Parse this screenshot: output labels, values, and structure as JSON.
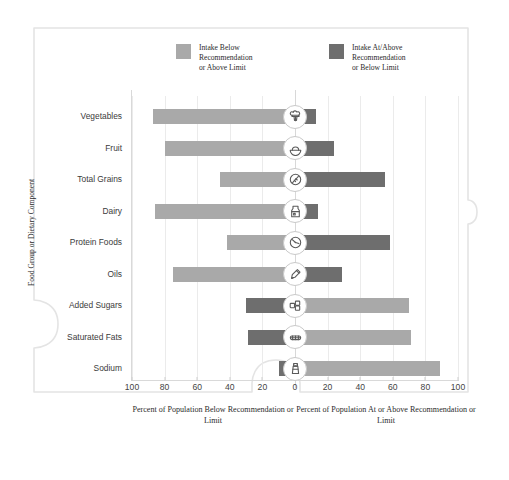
{
  "chart_data": {
    "type": "bar",
    "orientation": "horizontal-diverging",
    "title": "",
    "subtitle": "",
    "xlabel_left": "Percent of Population Below Recommendation or Limit",
    "xlabel_right": "Percent of Population At or Above Recommendation or Limit",
    "ylabel": "Food Group or Dietary Component",
    "grid": true,
    "legend_position": "top",
    "xlim": [
      -100,
      100
    ],
    "xticks": [
      {
        "label": "100",
        "value": -100
      },
      {
        "label": "80",
        "value": -80
      },
      {
        "label": "60",
        "value": -60
      },
      {
        "label": "40",
        "value": -40
      },
      {
        "label": "20",
        "value": -20
      },
      {
        "label": "0",
        "value": 0
      },
      {
        "label": "20",
        "value": 20
      },
      {
        "label": "40",
        "value": 40
      },
      {
        "label": "60",
        "value": 60
      },
      {
        "label": "80",
        "value": 80
      },
      {
        "label": "100",
        "value": 100
      }
    ],
    "categories": [
      "Vegetables",
      "Fruit",
      "Total Grains",
      "Dairy",
      "Protein Foods",
      "Oils",
      "Added Sugars",
      "Saturated Fats",
      "Sodium"
    ],
    "series": [
      {
        "name": "Intake Below Recommendation or Above Limit",
        "color": "#a9a9a9",
        "values": [
          87,
          80,
          46,
          86,
          42,
          75,
          70,
          71,
          89
        ]
      },
      {
        "name": "Intake At/Above Recommendation or Below Limit",
        "color": "#6e6e6e",
        "values": [
          13,
          20,
          54,
          14,
          58,
          25,
          30,
          29,
          11
        ]
      }
    ],
    "rows": [
      {
        "category": "Vegetables",
        "left_value": 87,
        "right_value": 13,
        "left_color": "#a9a9a9",
        "right_color": "#6e6e6e",
        "icon": "broccoli-icon"
      },
      {
        "category": "Fruit",
        "left_value": 80,
        "right_value": 24,
        "left_color": "#a9a9a9",
        "right_color": "#6e6e6e",
        "icon": "fruit-icon"
      },
      {
        "category": "Total Grains",
        "left_value": 46,
        "right_value": 55,
        "left_color": "#a9a9a9",
        "right_color": "#6e6e6e",
        "icon": "grains-icon"
      },
      {
        "category": "Dairy",
        "left_value": 86,
        "right_value": 14,
        "left_color": "#a9a9a9",
        "right_color": "#6e6e6e",
        "icon": "dairy-icon"
      },
      {
        "category": "Protein Foods",
        "left_value": 42,
        "right_value": 58,
        "left_color": "#a9a9a9",
        "right_color": "#6e6e6e",
        "icon": "protein-icon"
      },
      {
        "category": "Oils",
        "left_value": 75,
        "right_value": 29,
        "left_color": "#a9a9a9",
        "right_color": "#6e6e6e",
        "icon": "oils-icon"
      },
      {
        "category": "Added Sugars",
        "left_value": 30,
        "right_value": 70,
        "left_color": "#6e6e6e",
        "right_color": "#a9a9a9",
        "icon": "added-sugars-icon"
      },
      {
        "category": "Saturated Fats",
        "left_value": 29,
        "right_value": 71,
        "left_color": "#6e6e6e",
        "right_color": "#a9a9a9",
        "icon": "saturated-fats-icon"
      },
      {
        "category": "Sodium",
        "left_value": 10,
        "right_value": 89,
        "left_color": "#6e6e6e",
        "right_color": "#a9a9a9",
        "icon": "sodium-icon"
      }
    ]
  },
  "legend": {
    "items": [
      {
        "label_line1": "Intake Below",
        "label_line2": "Recommendation",
        "label_line3": "or Above Limit",
        "color": "#a9a9a9"
      },
      {
        "label_line1": "Intake At/Above",
        "label_line2": "Recommendation",
        "label_line3": "or Below Limit",
        "color": "#6e6e6e"
      }
    ]
  },
  "colors": {
    "below": "#a9a9a9",
    "above": "#6e6e6e",
    "grid": "#ebebeb",
    "axis": "#d9d9d9",
    "border": "#e2e2e2",
    "text": "#3b3b3b"
  }
}
